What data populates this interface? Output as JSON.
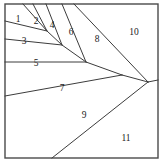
{
  "figure": {
    "region_count": 11,
    "frame": {
      "x": 5,
      "y": 4,
      "width": 153,
      "height": 154,
      "stroke": "#4a4a4a",
      "fill": "#ffffff"
    },
    "line_color": "#3c3c3c",
    "label_color": "#1a1a1a",
    "background": "#ffffff",
    "labels": [
      {
        "text": "1",
        "x": 18,
        "y": 20
      },
      {
        "text": "2",
        "x": 36,
        "y": 22
      },
      {
        "text": "4",
        "x": 52,
        "y": 26
      },
      {
        "text": "3",
        "x": 24,
        "y": 42
      },
      {
        "text": "6",
        "x": 71,
        "y": 33
      },
      {
        "text": "8",
        "x": 97,
        "y": 40
      },
      {
        "text": "10",
        "x": 134,
        "y": 33
      },
      {
        "text": "5",
        "x": 36,
        "y": 64
      },
      {
        "text": "7",
        "x": 62,
        "y": 89
      },
      {
        "text": "9",
        "x": 84,
        "y": 116
      },
      {
        "text": "11",
        "x": 126,
        "y": 139
      }
    ],
    "segments": [
      {
        "name": "seg-1-2",
        "x1": 23,
        "y1": 4,
        "x2": 47,
        "y2": 31
      },
      {
        "name": "seg-2-4",
        "x1": 33,
        "y1": 4,
        "x2": 47,
        "y2": 31
      },
      {
        "name": "seg-4-6",
        "x1": 46,
        "y1": 4,
        "x2": 62,
        "y2": 45
      },
      {
        "name": "seg-6-8",
        "x1": 62,
        "y1": 4,
        "x2": 86,
        "y2": 62
      },
      {
        "name": "seg-8-10",
        "x1": 74,
        "y1": 4,
        "x2": 148,
        "y2": 82
      },
      {
        "name": "seg-1-3",
        "x1": 5,
        "y1": 21,
        "x2": 47,
        "y2": 31
      },
      {
        "name": "seg-3-5",
        "x1": 5,
        "y1": 39,
        "x2": 62,
        "y2": 45
      },
      {
        "name": "seg-5-7",
        "x1": 5,
        "y1": 62,
        "x2": 86,
        "y2": 62
      },
      {
        "name": "seg-7-9",
        "x1": 5,
        "y1": 96,
        "x2": 122,
        "y2": 75
      },
      {
        "name": "seg-9-11",
        "x1": 52,
        "y1": 158,
        "x2": 148,
        "y2": 82
      },
      {
        "name": "seg-4-vertex",
        "x1": 47,
        "y1": 31,
        "x2": 62,
        "y2": 45
      },
      {
        "name": "seg-6-vertex",
        "x1": 62,
        "y1": 45,
        "x2": 86,
        "y2": 62
      },
      {
        "name": "seg-8-vertex",
        "x1": 86,
        "y1": 62,
        "x2": 122,
        "y2": 75
      },
      {
        "name": "seg-10-vertex",
        "x1": 122,
        "y1": 75,
        "x2": 148,
        "y2": 82
      },
      {
        "name": "seg-right-edge",
        "x1": 148,
        "y1": 82,
        "x2": 158,
        "y2": 80
      }
    ]
  }
}
